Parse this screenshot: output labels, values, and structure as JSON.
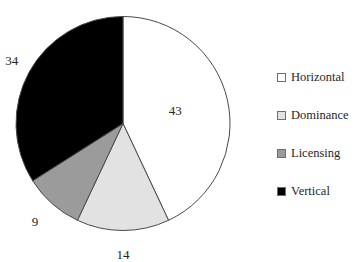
{
  "chart_data": {
    "type": "pie",
    "title": "",
    "subtitle": "",
    "xlabel": "",
    "ylabel": "",
    "grid": false,
    "legend_position": "right",
    "start_angle_deg": 0,
    "direction": "clockwise",
    "total": 100,
    "categories": [
      "Horizontal",
      "Dominance",
      "Licensing",
      "Vertical"
    ],
    "values": [
      43,
      14,
      9,
      34
    ],
    "labels": [
      "43",
      "14",
      "9",
      "34"
    ],
    "colors": [
      "#ffffff",
      "#e2e2e2",
      "#9b9b9b",
      "#000000"
    ],
    "slice_border_color": "#4a4a4a",
    "slices": [
      {
        "name": "Horizontal",
        "value": 43,
        "label": "43",
        "color": "#ffffff"
      },
      {
        "name": "Dominance",
        "value": 14,
        "label": "14",
        "color": "#e2e2e2"
      },
      {
        "name": "Licensing",
        "value": 9,
        "label": "9",
        "color": "#9b9b9b"
      },
      {
        "name": "Vertical",
        "value": 34,
        "label": "34",
        "color": "#000000"
      }
    ]
  },
  "legend": {
    "items": [
      {
        "label": "Horizontal",
        "color": "#ffffff"
      },
      {
        "label": "Dominance",
        "color": "#e2e2e2"
      },
      {
        "label": "Licensing",
        "color": "#9b9b9b"
      },
      {
        "label": "Vertical",
        "color": "#000000"
      }
    ]
  },
  "data_labels": {
    "horizontal": "43",
    "dominance": "14",
    "licensing": "9",
    "vertical": "34"
  }
}
